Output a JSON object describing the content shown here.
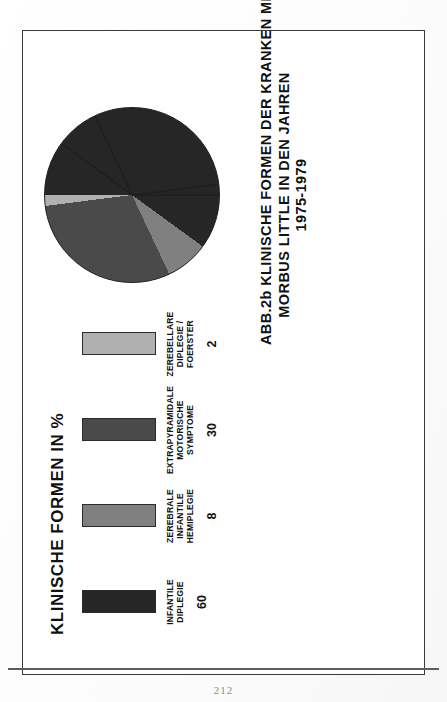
{
  "document": {
    "page_number": "212"
  },
  "figure": {
    "key": {
      "title": "KLINISCHE FORMEN IN %",
      "items": [
        {
          "label": "INFANTILE DIPLEGIE",
          "value": "60",
          "color": "#262626"
        },
        {
          "label": "ZEREBRALE\nINFANTILE HEMIPLEGIE",
          "value": "8",
          "color": "#808080"
        },
        {
          "label": "EXTRAPYRAMIDALE\nMOTORISCHE SYMPTOME",
          "value": "30",
          "color": "#4a4a4a"
        },
        {
          "label": "ZEREBELLARE\nDIPLEGIE / FOERSTER",
          "value": "2",
          "color": "#b0b0b0"
        }
      ]
    },
    "caption": {
      "line1": "ABB.2b KLINISCHE FORMEN DER KRANKEN MIT",
      "line2": "MORBUS LITTLE IN DEN JAHREN",
      "line3": "1975-1979"
    }
  },
  "chart_data": {
    "type": "pie",
    "title": "ABB.2b KLINISCHE FORMEN DER KRANKEN MIT MORBUS LITTLE IN DEN JAHREN 1975-1979",
    "subtitle": "KLINISCHE FORMEN IN %",
    "unit": "%",
    "categories": [
      "INFANTILE DIPLEGIE",
      "ZEREBRALE INFANTILE HEMIPLEGIE",
      "EXTRAPYRAMIDALE MOTORISCHE SYMPTOME",
      "ZEREBELLARE DIPLEGIE / FOERSTER"
    ],
    "values": [
      60,
      8,
      30,
      2
    ],
    "colors": [
      "#262626",
      "#808080",
      "#4a4a4a",
      "#b0b0b0"
    ],
    "legend_position": "top",
    "grid": false,
    "start_angle_deg": 0,
    "rotation_deg": -90
  }
}
